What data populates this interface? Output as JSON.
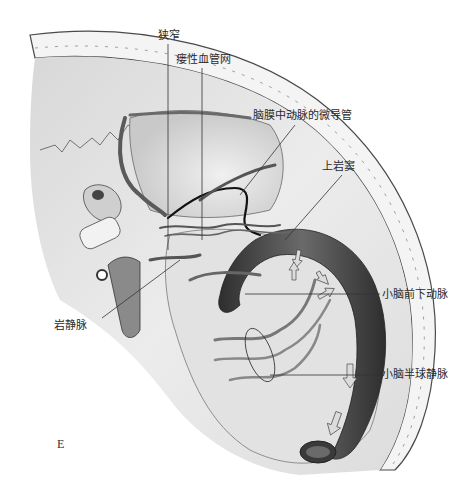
{
  "figure": {
    "panel_letter": "E",
    "labels": {
      "stenosis": "狭窄",
      "fistula_network": "瘘性血管网",
      "mma_microcatheter": "脑膜中动脉的微导管",
      "superior_petrosal_sinus": "上岩窦",
      "aica": "小脑前下动脉",
      "petrosal_vein": "岩静脉",
      "cerebellar_hemispheric_vein": "小脑半球静脉"
    },
    "colors": {
      "ink": "#2a2a2a",
      "vessel_dark": "#3a3a3a",
      "vessel_mid": "#6e6e6e",
      "skull_fill": "#e6e6e6",
      "bone_light": "#f2f2f2",
      "background": "#ffffff"
    }
  }
}
